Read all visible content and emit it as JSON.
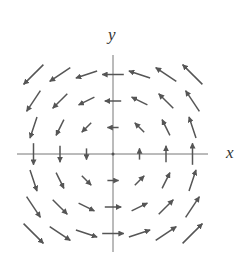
{
  "diagram": {
    "type": "vector-field",
    "field": "F(x,y) = (-y, x)",
    "axes": {
      "x_label": "x",
      "y_label": "y"
    },
    "grid": {
      "x_values": [
        -3,
        -2,
        -1,
        0,
        1,
        2,
        3
      ],
      "y_values": [
        -3,
        -2,
        -1,
        0,
        1,
        2,
        3
      ]
    },
    "colors": {
      "arrow": "#555555",
      "axis": "#777777",
      "label": "#333333",
      "background": "#ffffff"
    }
  }
}
